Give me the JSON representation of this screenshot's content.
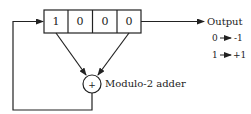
{
  "diagram": {
    "type": "shift-register-sequence-generator",
    "register": {
      "cells": [
        "1",
        "0",
        "0",
        "0"
      ]
    },
    "adder": {
      "symbol": "+",
      "label": "Modulo-2 adder"
    },
    "output": {
      "label": "Output",
      "mapping": [
        {
          "from": "0",
          "to": "-1"
        },
        {
          "from": "1",
          "to": "+1"
        }
      ]
    },
    "colors": {
      "line": "#222222",
      "background": "#ffffff"
    }
  }
}
